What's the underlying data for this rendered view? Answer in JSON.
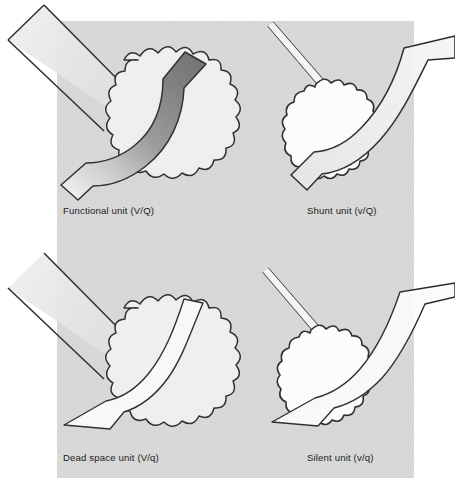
{
  "figure": {
    "domain": "diagram",
    "canvas": {
      "width": 455,
      "height": 490
    },
    "card": {
      "name": "scanned-page-card",
      "x": 57,
      "y": 21,
      "width": 357,
      "height": 457,
      "background_color": "#d8d8d8",
      "outside_color": "#ffffff"
    },
    "notation_key": {
      "uppercase_V": "normal ventilation",
      "lowercase_v": "reduced / absent ventilation",
      "uppercase_Q": "normal perfusion",
      "lowercase_q": "reduced / absent perfusion"
    },
    "colors": {
      "outline": "#2b2b2b",
      "alveolus_open_fill": "#f1f1f1",
      "alveolus_collapsed_fill": "#ffffff",
      "vessel_deoxygenated": "#7c7c7c",
      "vessel_oxygenated": "#f3f3f3",
      "vessel_collapsed_fill": "#fbfbfb",
      "card_background": "#d8d8d8",
      "label_text": "#1b1b1b"
    },
    "units": [
      {
        "id": "functional",
        "label": "Functional unit (V/Q)",
        "quadrant": "top-left",
        "ventilation": "normal",
        "perfusion": "normal",
        "alveolus_state": "open",
        "alveolus_shape": "round-scalloped",
        "alveolus_fill": "#f1f1f1",
        "airway_state": "open",
        "airway_style": "wide-band",
        "vessel_state": "patent",
        "vessel_style": "wide-gradient",
        "vessel_fill_start": "#7c7c7c",
        "vessel_fill_end": "#f0f0f0",
        "vessel_note": "dark (deoxygenated) inflow shading to light (oxygenated) outflow"
      },
      {
        "id": "shunt",
        "label": "Shunt unit (v/Q)",
        "quadrant": "top-right",
        "ventilation": "absent",
        "perfusion": "normal",
        "alveolus_state": "collapsed",
        "alveolus_shape": "elongated-scalloped",
        "alveolus_fill": "#ffffff",
        "airway_state": "collapsed",
        "airway_style": "thin-line",
        "vessel_state": "patent",
        "vessel_style": "wide-light",
        "vessel_fill_start": "#f4f4f4",
        "vessel_fill_end": "#ededed",
        "vessel_note": "wide perfused vessel remains light (blood stays deoxygenated, no gas exchange)"
      },
      {
        "id": "dead-space",
        "label": "Dead space unit (V/q)",
        "quadrant": "bottom-left",
        "ventilation": "normal",
        "perfusion": "absent",
        "alveolus_state": "open",
        "alveolus_shape": "round-scalloped",
        "alveolus_fill": "#f1f1f1",
        "airway_state": "open",
        "airway_style": "wide-band",
        "vessel_state": "collapsed",
        "vessel_style": "thin-line",
        "vessel_fill_start": "#fbfbfb",
        "vessel_fill_end": "#fbfbfb",
        "vessel_note": "narrow collapsed capillary, no perfusion"
      },
      {
        "id": "silent",
        "label": "Silent unit (v/q)",
        "quadrant": "bottom-right",
        "ventilation": "absent",
        "perfusion": "absent",
        "alveolus_state": "collapsed",
        "alveolus_shape": "elongated-scalloped",
        "alveolus_fill": "#ffffff",
        "airway_state": "collapsed",
        "airway_style": "thin-line",
        "vessel_state": "collapsed",
        "vessel_style": "thin-line",
        "vessel_fill_start": "#fbfbfb",
        "vessel_fill_end": "#fbfbfb",
        "vessel_note": "narrow collapsed capillary, no perfusion"
      }
    ]
  }
}
